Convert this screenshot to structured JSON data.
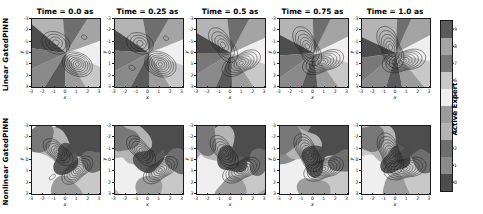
{
  "figure": {
    "width": 483,
    "height": 214,
    "background": "#ffffff"
  },
  "rows": [
    {
      "id": "linear",
      "label": "Linear GatedPINN"
    },
    {
      "id": "nonlinear",
      "label": "Nonlinear GatedPINN"
    }
  ],
  "columns": [
    {
      "title": "Time = 0.0 as",
      "time": 0.0
    },
    {
      "title": "Time = 0.25 as",
      "time": 0.25
    },
    {
      "title": "Time = 0.5 as",
      "time": 0.5
    },
    {
      "title": "Time = 0.75 as",
      "time": 0.75
    },
    {
      "title": "Time = 1.0 as",
      "time": 1.0
    }
  ],
  "axes": {
    "xlabel": "x",
    "ylabel": "y",
    "xticks": [
      "-3",
      "-2",
      "-1",
      "0",
      "1",
      "2",
      "3"
    ],
    "yticks": [
      "-3",
      "-2",
      "-1",
      "0",
      "1",
      "2",
      "3"
    ],
    "xlim": [
      -3,
      3
    ],
    "ylim": [
      -3,
      3
    ]
  },
  "colorbar": {
    "label": "Active Expert",
    "ticks": [
      "0",
      "1",
      "2",
      "3",
      "4",
      "5",
      "6",
      "7",
      "8",
      "9"
    ],
    "vmin": 0,
    "vmax": 9,
    "colors": [
      "#4d4d4d",
      "#8a8a8a",
      "#6e6e6e",
      "#b4b4b4",
      "#9c9c9c",
      "#efefef",
      "#c8c8c8",
      "#787878",
      "#a4a4a4",
      "#5a5a5a"
    ]
  },
  "chart_data": {
    "type": "heatmap",
    "title": "",
    "xlabel": "x",
    "ylabel": "y",
    "xlim": [
      -3,
      3
    ],
    "ylim": [
      -3,
      3
    ],
    "grid": false,
    "legend": "colorbar-right",
    "colorbar_label": "Active Expert",
    "colorbar_range": [
      0,
      9
    ],
    "rows": [
      {
        "name": "Linear GatedPINN",
        "panels": [
          {
            "time": 0.0,
            "expert_regions": "radial pie sectors emanating from origin",
            "sectors": [
              {
                "expert": 3,
                "start_deg": 95,
                "end_deg": 140
              },
              {
                "expert": 0,
                "start_deg": 140,
                "end_deg": 172
              },
              {
                "expert": 7,
                "start_deg": 172,
                "end_deg": 205
              },
              {
                "expert": 1,
                "start_deg": 205,
                "end_deg": 238
              },
              {
                "expert": 9,
                "start_deg": 238,
                "end_deg": 268
              },
              {
                "expert": 4,
                "start_deg": 268,
                "end_deg": 300
              },
              {
                "expert": 6,
                "start_deg": 300,
                "end_deg": 338
              },
              {
                "expert": 5,
                "start_deg": 338,
                "end_deg": 20
              },
              {
                "expert": 8,
                "start_deg": 20,
                "end_deg": 58
              },
              {
                "expert": 2,
                "start_deg": 58,
                "end_deg": 95
              }
            ],
            "contours": [
              {
                "cx": -0.9,
                "cy": 0.9,
                "rings": 4,
                "rmax": 1.15
              },
              {
                "cx": 1.0,
                "cy": -1.0,
                "rings": 7,
                "rmax": 1.25
              },
              {
                "cx": 1.6,
                "cy": 1.4,
                "rings": 1,
                "rmax": 0.22
              }
            ]
          },
          {
            "time": 0.25,
            "sectors": [
              {
                "expert": 3,
                "start_deg": 100,
                "end_deg": 146
              },
              {
                "expert": 0,
                "start_deg": 146,
                "end_deg": 176
              },
              {
                "expert": 7,
                "start_deg": 176,
                "end_deg": 208
              },
              {
                "expert": 1,
                "start_deg": 208,
                "end_deg": 242
              },
              {
                "expert": 9,
                "start_deg": 242,
                "end_deg": 270
              },
              {
                "expert": 4,
                "start_deg": 270,
                "end_deg": 302
              },
              {
                "expert": 6,
                "start_deg": 302,
                "end_deg": 340
              },
              {
                "expert": 5,
                "start_deg": 340,
                "end_deg": 22
              },
              {
                "expert": 8,
                "start_deg": 22,
                "end_deg": 60
              },
              {
                "expert": 2,
                "start_deg": 60,
                "end_deg": 100
              }
            ],
            "contours": [
              {
                "cx": -0.8,
                "cy": 0.85,
                "rings": 4,
                "rmax": 1.1
              },
              {
                "cx": 1.0,
                "cy": -1.0,
                "rings": 7,
                "rmax": 1.3
              },
              {
                "cx": -1.5,
                "cy": -1.3,
                "rings": 1,
                "rmax": 0.25
              },
              {
                "cx": 1.5,
                "cy": 1.3,
                "rings": 1,
                "rmax": 0.22
              }
            ]
          },
          {
            "time": 0.5,
            "sectors": [
              {
                "expert": 3,
                "start_deg": 96,
                "end_deg": 150
              },
              {
                "expert": 0,
                "start_deg": 150,
                "end_deg": 180
              },
              {
                "expert": 7,
                "start_deg": 180,
                "end_deg": 212
              },
              {
                "expert": 1,
                "start_deg": 212,
                "end_deg": 246
              },
              {
                "expert": 9,
                "start_deg": 246,
                "end_deg": 272
              },
              {
                "expert": 4,
                "start_deg": 272,
                "end_deg": 304
              },
              {
                "expert": 6,
                "start_deg": 304,
                "end_deg": 342
              },
              {
                "expert": 5,
                "start_deg": 342,
                "end_deg": 24
              },
              {
                "expert": 8,
                "start_deg": 24,
                "end_deg": 62
              },
              {
                "expert": 2,
                "start_deg": 62,
                "end_deg": 96
              }
            ],
            "contours": [
              {
                "cx": -0.7,
                "cy": 0.7,
                "rings": 5,
                "rmax": 1.35
              },
              {
                "cx": 0.9,
                "cy": -0.9,
                "rings": 7,
                "rmax": 1.4
              }
            ]
          },
          {
            "time": 0.75,
            "sectors": [
              {
                "expert": 3,
                "start_deg": 92,
                "end_deg": 152
              },
              {
                "expert": 0,
                "start_deg": 152,
                "end_deg": 184
              },
              {
                "expert": 7,
                "start_deg": 184,
                "end_deg": 216
              },
              {
                "expert": 1,
                "start_deg": 216,
                "end_deg": 250
              },
              {
                "expert": 9,
                "start_deg": 250,
                "end_deg": 276
              },
              {
                "expert": 4,
                "start_deg": 276,
                "end_deg": 306
              },
              {
                "expert": 6,
                "start_deg": 306,
                "end_deg": 344
              },
              {
                "expert": 5,
                "start_deg": 344,
                "end_deg": 26
              },
              {
                "expert": 8,
                "start_deg": 26,
                "end_deg": 64
              },
              {
                "expert": 2,
                "start_deg": 64,
                "end_deg": 92
              }
            ],
            "contours": [
              {
                "cx": -0.6,
                "cy": 0.6,
                "rings": 6,
                "rmax": 1.45
              },
              {
                "cx": 0.8,
                "cy": -0.8,
                "rings": 7,
                "rmax": 1.45
              }
            ]
          },
          {
            "time": 1.0,
            "sectors": [
              {
                "expert": 3,
                "start_deg": 88,
                "end_deg": 155
              },
              {
                "expert": 0,
                "start_deg": 155,
                "end_deg": 188
              },
              {
                "expert": 7,
                "start_deg": 188,
                "end_deg": 220
              },
              {
                "expert": 1,
                "start_deg": 220,
                "end_deg": 254
              },
              {
                "expert": 9,
                "start_deg": 254,
                "end_deg": 280
              },
              {
                "expert": 4,
                "start_deg": 280,
                "end_deg": 310
              },
              {
                "expert": 6,
                "start_deg": 310,
                "end_deg": 346
              },
              {
                "expert": 5,
                "start_deg": 346,
                "end_deg": 28
              },
              {
                "expert": 8,
                "start_deg": 28,
                "end_deg": 66
              },
              {
                "expert": 2,
                "start_deg": 66,
                "end_deg": 88
              }
            ],
            "contours": [
              {
                "cx": -0.5,
                "cy": 0.5,
                "rings": 6,
                "rmax": 1.5
              },
              {
                "cx": 0.7,
                "cy": -0.7,
                "rings": 7,
                "rmax": 1.5
              }
            ]
          }
        ]
      },
      {
        "name": "Nonlinear GatedPINN",
        "panels": [
          {
            "time": 0.0,
            "expert_regions": "irregular curved partitions",
            "contours": [
              {
                "cx": -0.7,
                "cy": 0.7,
                "rings": 6,
                "rmax": 1.2
              },
              {
                "cx": 1.0,
                "cy": -0.9,
                "rings": 7,
                "rmax": 1.25
              },
              {
                "cx": -1.2,
                "cy": -1.5,
                "rings": 1,
                "rmax": 0.25
              }
            ]
          },
          {
            "time": 0.25,
            "contours": [
              {
                "cx": -0.7,
                "cy": 0.8,
                "rings": 6,
                "rmax": 1.25
              },
              {
                "cx": 1.0,
                "cy": -0.9,
                "rings": 7,
                "rmax": 1.3
              }
            ]
          },
          {
            "time": 0.5,
            "contours": [
              {
                "cx": -0.6,
                "cy": 0.7,
                "rings": 6,
                "rmax": 1.3
              },
              {
                "cx": 0.9,
                "cy": -0.9,
                "rings": 7,
                "rmax": 1.35
              }
            ]
          },
          {
            "time": 0.75,
            "contours": [
              {
                "cx": -0.55,
                "cy": 0.65,
                "rings": 7,
                "rmax": 1.4
              },
              {
                "cx": 0.85,
                "cy": -0.8,
                "rings": 7,
                "rmax": 1.4
              }
            ]
          },
          {
            "time": 1.0,
            "contours": [
              {
                "cx": -0.5,
                "cy": 0.6,
                "rings": 7,
                "rmax": 1.45
              },
              {
                "cx": 0.8,
                "cy": -0.75,
                "rings": 7,
                "rmax": 1.45
              }
            ]
          }
        ]
      }
    ]
  }
}
